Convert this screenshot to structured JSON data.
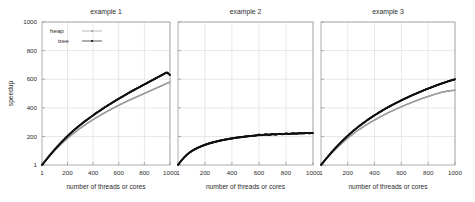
{
  "figure": {
    "xlabel": "number of threads or cores",
    "ylabel": "speedup",
    "legend": {
      "heap": "heap",
      "tree": "tree"
    }
  },
  "panels": [
    {
      "title": "example 1"
    },
    {
      "title": "example 2"
    },
    {
      "title": "example 3"
    }
  ],
  "axes": {
    "xticks": [
      "1",
      "200",
      "400",
      "600",
      "800",
      "1000"
    ],
    "yticks": [
      "1",
      "200",
      "400",
      "600",
      "800",
      "1000"
    ]
  },
  "chart_data": [
    {
      "type": "line",
      "title": "example 1",
      "xlabel": "number of threads or cores",
      "ylabel": "speedup",
      "xlim": [
        1,
        1000
      ],
      "ylim": [
        1,
        1000
      ],
      "xticks": [
        1,
        200,
        400,
        600,
        800,
        1000
      ],
      "yticks": [
        1,
        200,
        400,
        600,
        800,
        1000
      ],
      "grid": true,
      "legend": "top-left",
      "x": [
        1,
        25,
        50,
        75,
        100,
        125,
        150,
        175,
        200,
        225,
        250,
        275,
        300,
        325,
        350,
        375,
        400,
        425,
        450,
        475,
        500,
        525,
        550,
        575,
        600,
        625,
        650,
        675,
        700,
        725,
        750,
        775,
        800,
        825,
        850,
        875,
        900,
        925,
        950,
        975,
        1000
      ],
      "series": [
        {
          "name": "heap",
          "color": "#9d9d9d",
          "values": [
            1,
            26,
            52,
            77,
            101,
            124,
            146,
            167,
            187,
            206,
            224,
            241,
            258,
            274,
            289,
            304,
            318,
            332,
            345,
            358,
            371,
            383,
            395,
            407,
            418,
            429,
            440,
            451,
            461,
            471,
            481,
            491,
            501,
            511,
            521,
            531,
            541,
            551,
            561,
            571,
            580
          ]
        },
        {
          "name": "tree",
          "color": "#111111",
          "values": [
            1,
            28,
            56,
            83,
            109,
            134,
            158,
            181,
            203,
            224,
            244,
            263,
            281,
            299,
            316,
            332,
            348,
            364,
            379,
            394,
            409,
            423,
            437,
            451,
            464,
            477,
            490,
            503,
            516,
            528,
            540,
            552,
            564,
            576,
            588,
            600,
            612,
            624,
            636,
            648,
            630
          ]
        }
      ]
    },
    {
      "type": "line",
      "title": "example 2",
      "xlabel": "number of threads or cores",
      "ylabel": "speedup",
      "xlim": [
        1,
        1000
      ],
      "ylim": [
        1,
        1000
      ],
      "xticks": [
        1,
        200,
        400,
        600,
        800,
        1000
      ],
      "yticks": [
        1,
        200,
        400,
        600,
        800,
        1000
      ],
      "grid": true,
      "legend": "none",
      "x": [
        1,
        25,
        50,
        75,
        100,
        125,
        150,
        175,
        200,
        225,
        250,
        275,
        300,
        325,
        350,
        375,
        400,
        425,
        450,
        475,
        500,
        525,
        550,
        575,
        600,
        625,
        650,
        675,
        700,
        725,
        750,
        775,
        800,
        825,
        850,
        875,
        900,
        925,
        950,
        975,
        1000
      ],
      "series": [
        {
          "name": "heap",
          "color": "#9d9d9d",
          "values": [
            1,
            30,
            56,
            77,
            94,
            108,
            120,
            130,
            139,
            147,
            154,
            160,
            166,
            171,
            176,
            180,
            184,
            188,
            191,
            194,
            197,
            200,
            202,
            204,
            206,
            208,
            210,
            212,
            213,
            215,
            216,
            217,
            218,
            219,
            220,
            221,
            221,
            222,
            222,
            223,
            223
          ]
        },
        {
          "name": "tree",
          "color": "#111111",
          "values": [
            1,
            31,
            58,
            80,
            97,
            111,
            123,
            133,
            142,
            150,
            157,
            163,
            169,
            174,
            179,
            183,
            187,
            191,
            194,
            197,
            200,
            203,
            205,
            207,
            213,
            210,
            215,
            212,
            217,
            214,
            219,
            216,
            221,
            218,
            222,
            220,
            223,
            222,
            224,
            223,
            224
          ]
        }
      ]
    },
    {
      "type": "line",
      "title": "example 3",
      "xlabel": "number of threads or cores",
      "ylabel": "speedup",
      "xlim": [
        1,
        1000
      ],
      "ylim": [
        1,
        1000
      ],
      "xticks": [
        1,
        200,
        400,
        600,
        800,
        1000
      ],
      "yticks": [
        1,
        200,
        400,
        600,
        800,
        1000
      ],
      "grid": true,
      "legend": "none",
      "x": [
        1,
        25,
        50,
        75,
        100,
        125,
        150,
        175,
        200,
        225,
        250,
        275,
        300,
        325,
        350,
        375,
        400,
        425,
        450,
        475,
        500,
        525,
        550,
        575,
        600,
        625,
        650,
        675,
        700,
        725,
        750,
        775,
        800,
        825,
        850,
        875,
        900,
        925,
        950,
        975,
        1000
      ],
      "series": [
        {
          "name": "heap",
          "color": "#9d9d9d",
          "values": [
            1,
            27,
            53,
            78,
            102,
            125,
            147,
            168,
            188,
            207,
            225,
            242,
            258,
            273,
            288,
            302,
            315,
            328,
            341,
            353,
            365,
            376,
            387,
            398,
            408,
            418,
            428,
            437,
            446,
            455,
            464,
            472,
            480,
            488,
            495,
            502,
            509,
            514,
            518,
            521,
            523
          ]
        },
        {
          "name": "tree",
          "color": "#111111",
          "values": [
            1,
            29,
            57,
            85,
            111,
            136,
            160,
            183,
            205,
            226,
            246,
            265,
            283,
            300,
            317,
            333,
            348,
            363,
            377,
            391,
            404,
            417,
            429,
            441,
            453,
            464,
            475,
            486,
            496,
            506,
            516,
            526,
            535,
            544,
            553,
            562,
            570,
            578,
            586,
            593,
            600
          ]
        }
      ]
    }
  ]
}
